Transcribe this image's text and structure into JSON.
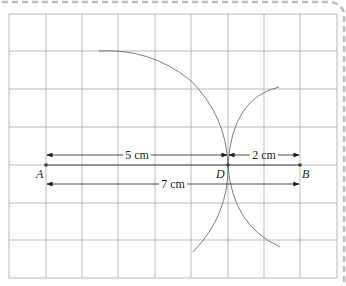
{
  "diagram": {
    "type": "geometric-construction",
    "grid": {
      "x_lines": [
        9,
        46,
        82,
        118,
        155,
        191,
        228,
        264,
        300,
        337
      ],
      "y_lines": [
        14,
        51,
        89,
        127,
        165,
        203,
        240,
        278
      ],
      "color": "#a7a9ac"
    },
    "frame": {
      "dash_color": "#bcbec0"
    },
    "points": [
      {
        "label": "A",
        "x": 46,
        "y": 165,
        "label_x": 36,
        "label_y": 178
      },
      {
        "label": "D",
        "x": 228,
        "y": 165,
        "label_x": 216,
        "label_y": 178
      },
      {
        "label": "B",
        "x": 300,
        "y": 165,
        "label_x": 302,
        "label_y": 178
      }
    ],
    "measurements": [
      {
        "label": "5 cm",
        "x1": 46,
        "x2": 228,
        "y": 155,
        "text_x": 137,
        "text_y": 159
      },
      {
        "label": "2 cm",
        "x1": 228,
        "x2": 300,
        "y": 155,
        "text_x": 264,
        "text_y": 159
      },
      {
        "label": "7 cm",
        "x1": 46,
        "x2": 300,
        "y": 184,
        "text_x": 173,
        "text_y": 188
      }
    ],
    "line_color": "#231f20",
    "arc_color": "#6d6e71"
  }
}
